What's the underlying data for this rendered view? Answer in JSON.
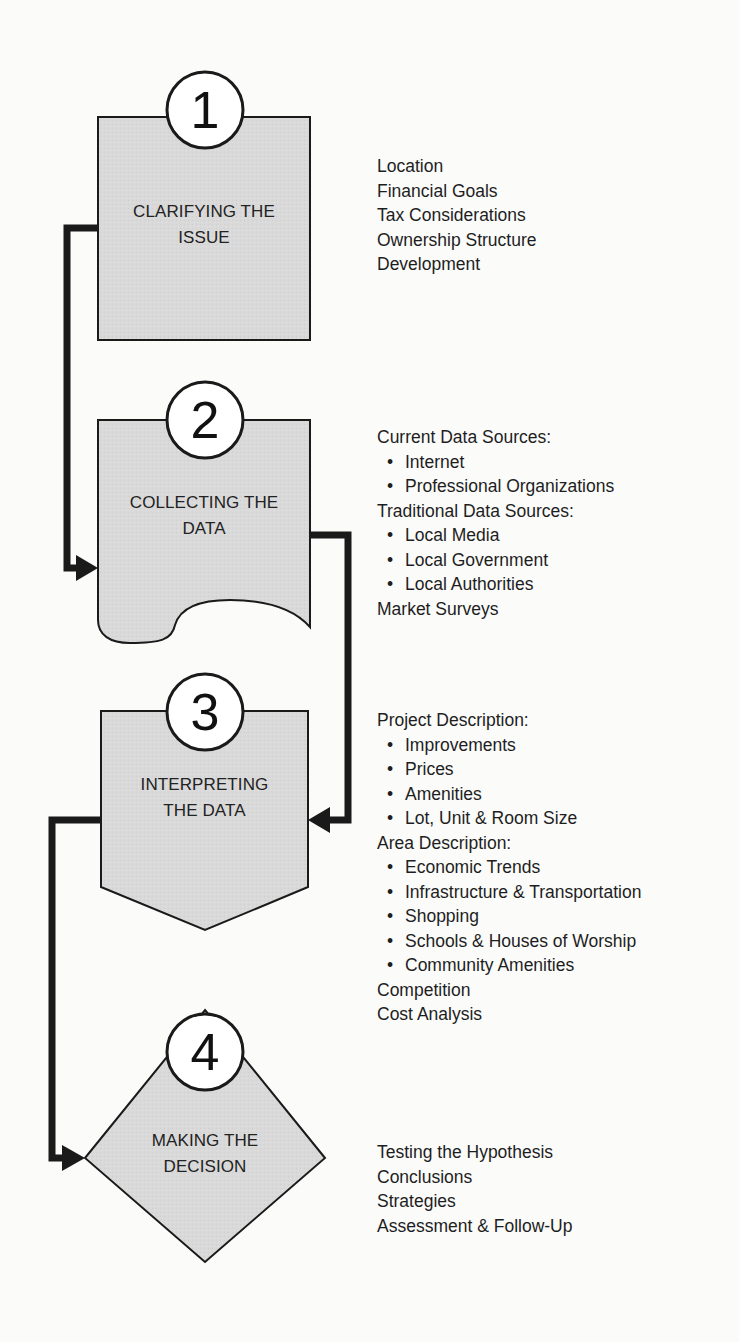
{
  "colors": {
    "background": "#fbfbfa",
    "shape_fill": "#d9d9d9",
    "stroke": "#1a1a1a",
    "circle_fill": "#ffffff"
  },
  "steps": [
    {
      "number": "1",
      "shape": "rectangle",
      "label_line1": "CLARIFYING THE",
      "label_line2": "ISSUE",
      "notes": [
        {
          "type": "item",
          "text": "Location"
        },
        {
          "type": "item",
          "text": "Financial Goals"
        },
        {
          "type": "item",
          "text": "Tax Considerations"
        },
        {
          "type": "item",
          "text": "Ownership Structure"
        },
        {
          "type": "item",
          "text": "Development"
        }
      ]
    },
    {
      "number": "2",
      "shape": "document",
      "label_line1": "COLLECTING THE",
      "label_line2": "DATA",
      "notes": [
        {
          "type": "item",
          "text": "Current Data Sources:"
        },
        {
          "type": "bullet",
          "text": "Internet"
        },
        {
          "type": "bullet",
          "text": "Professional Organizations"
        },
        {
          "type": "item",
          "text": "Traditional Data Sources:"
        },
        {
          "type": "bullet",
          "text": "Local Media"
        },
        {
          "type": "bullet",
          "text": "Local Government"
        },
        {
          "type": "bullet",
          "text": "Local Authorities"
        },
        {
          "type": "item",
          "text": "Market Surveys"
        }
      ]
    },
    {
      "number": "3",
      "shape": "off-page-connector",
      "label_line1": "INTERPRETING",
      "label_line2": "THE DATA",
      "notes": [
        {
          "type": "item",
          "text": "Project Description:"
        },
        {
          "type": "bullet",
          "text": "Improvements"
        },
        {
          "type": "bullet",
          "text": "Prices"
        },
        {
          "type": "bullet",
          "text": "Amenities"
        },
        {
          "type": "bullet",
          "text": "Lot, Unit & Room Size"
        },
        {
          "type": "item",
          "text": "Area Description:"
        },
        {
          "type": "bullet",
          "text": "Economic Trends"
        },
        {
          "type": "bullet",
          "text": "Infrastructure & Transportation"
        },
        {
          "type": "bullet",
          "text": "Shopping"
        },
        {
          "type": "bullet",
          "text": "Schools & Houses of Worship"
        },
        {
          "type": "bullet",
          "text": "Community Amenities"
        },
        {
          "type": "item",
          "text": "Competition"
        },
        {
          "type": "item",
          "text": "Cost Analysis"
        }
      ]
    },
    {
      "number": "4",
      "shape": "diamond",
      "label_line1": "MAKING THE",
      "label_line2": "DECISION",
      "notes": [
        {
          "type": "item",
          "text": "Testing the Hypothesis"
        },
        {
          "type": "item",
          "text": "Conclusions"
        },
        {
          "type": "item",
          "text": "Strategies"
        },
        {
          "type": "item",
          "text": "Assessment & Follow-Up"
        }
      ]
    }
  ],
  "bullet_glyph": "•"
}
